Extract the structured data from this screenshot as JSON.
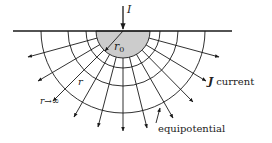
{
  "diagram": {
    "type": "hemispherical-electrode-current-flow",
    "center": [
      123,
      31
    ],
    "ground_line": {
      "x1": 13,
      "x2": 232,
      "y": 31
    },
    "electrode_radius": 27,
    "equipotential_radii": [
      27,
      37,
      55,
      82
    ],
    "current_ray_end_points": [
      [
        28,
        57
      ],
      [
        38,
        81
      ],
      [
        53,
        101
      ],
      [
        74,
        117
      ],
      [
        98,
        127
      ],
      [
        123,
        131
      ],
      [
        147,
        128
      ],
      [
        173,
        118
      ],
      [
        193,
        102
      ],
      [
        206,
        81
      ],
      [
        219,
        57
      ]
    ],
    "colors": {
      "line": "#1a1a1a",
      "electrode_fill": "#cccccc",
      "background": "#ffffff"
    }
  },
  "labels": {
    "current_in": "I",
    "electrode_radius": "r",
    "electrode_radius_sub": "0",
    "radius": "r",
    "infinity": "r→∞",
    "current_density_symbol": "J",
    "current_word": "current",
    "equipotential": "equipotential"
  }
}
